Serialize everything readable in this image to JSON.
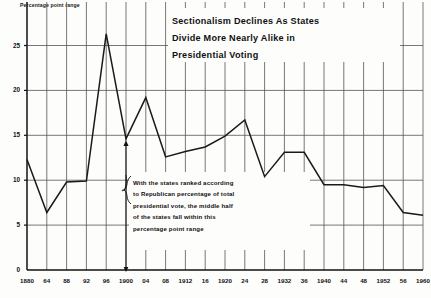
{
  "chart_data": {
    "type": "line",
    "title": "Sectionalism Declines As States Divide More Nearly Alike in Presidential Voting",
    "title_lines": [
      "Sectionalism Declines As States",
      "Divide More Nearly Alike in",
      "Presidential Voting"
    ],
    "ylabel": "Percentage point range",
    "xlabel": "",
    "ylim": [
      0,
      27
    ],
    "xlim": [
      1880,
      1960
    ],
    "grid": true,
    "legend": "none",
    "yticks": [
      0,
      5,
      10,
      15,
      20,
      25
    ],
    "ytick_labels": [
      "0",
      "5",
      "10",
      "15",
      "20",
      "25"
    ],
    "x": [
      1880,
      1884,
      1888,
      1892,
      1896,
      1900,
      1904,
      1908,
      1912,
      1916,
      1920,
      1924,
      1928,
      1932,
      1936,
      1940,
      1944,
      1948,
      1952,
      1956,
      1960
    ],
    "xtick_labels": [
      "1880",
      "64",
      "88",
      "92",
      "96",
      "1900",
      "04",
      "08",
      "1912",
      "16",
      "1920",
      "24",
      "28",
      "1932",
      "36",
      "1940",
      "44",
      "48",
      "1952",
      "56",
      "1960"
    ],
    "values": [
      12.3,
      6.4,
      9.8,
      9.9,
      26.3,
      14.6,
      19.2,
      12.6,
      13.2,
      13.7,
      14.9,
      16.7,
      10.4,
      13.1,
      13.1,
      9.5,
      9.5,
      9.2,
      9.4,
      6.4,
      6.1
    ],
    "annotation": {
      "lines": [
        "With the states ranked according",
        "to Republican percentage of total",
        "presidential vote, the middle half",
        "of the states fall within this",
        "percentage point range"
      ],
      "points_to_year": 1900,
      "points_to_value": 14.6
    },
    "line_color": "#1a1a1a",
    "grid_color": "#555555",
    "axis_color": "#111111",
    "background": "#fdfdfc"
  }
}
